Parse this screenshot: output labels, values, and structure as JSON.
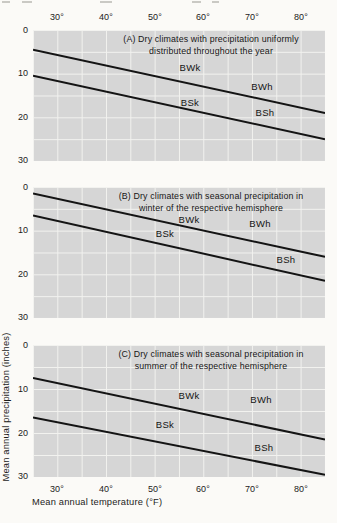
{
  "figure": {
    "description_domain": "Koppen dry climate boundary chart, three stacked panels"
  },
  "axes": {
    "x_title": "Mean annual temperature (°F)",
    "y_title": "Mean annual precipitation (inches)",
    "x_tick_labels": [
      "30°",
      "40°",
      "50°",
      "60°",
      "70°",
      "80°"
    ],
    "y_tick_labels": [
      "0",
      "10",
      "20",
      "30"
    ]
  },
  "panels": [
    {
      "letter": "A",
      "title_line1": "(A) Dry climates with precipitation uniformly",
      "title_line2": "distributed throughout the year"
    },
    {
      "letter": "B",
      "title_line1": "(B) Dry climates with seasonal precipitation in",
      "title_line2": "winter of the respective hemisphere"
    },
    {
      "letter": "C",
      "title_line1": "(C) Dry climates with seasonal precipitation in",
      "title_line2": "summer of the respective hemisphere"
    }
  ],
  "colors": {
    "panel_background": "#d6d6d6",
    "gridline": "#f2f2ef",
    "boundary_line": "#141414",
    "text": "#1b1b1b",
    "page_background": "#fbfaf7"
  },
  "chart_data": [
    {
      "type": "line",
      "title": "(A) Dry climates with precipitation uniformly distributed throughout the year",
      "xlabel": "Mean annual temperature (°F)",
      "ylabel": "Mean annual precipitation (inches)",
      "xlim": [
        25,
        85
      ],
      "ylim": [
        0,
        30
      ],
      "y_inverted": true,
      "x_ticks": [
        30,
        40,
        50,
        60,
        70,
        80
      ],
      "y_ticks": [
        0,
        10,
        20,
        30
      ],
      "grid": {
        "x_step": 5,
        "y_step": 5,
        "on": true
      },
      "legend": "none",
      "series": [
        {
          "name": "BW-BS boundary (upper line)",
          "x": [
            25,
            85
          ],
          "y": [
            4.5,
            19.0
          ]
        },
        {
          "name": "BS-humid boundary (lower line)",
          "x": [
            25,
            85
          ],
          "y": [
            10.5,
            25.0
          ]
        }
      ],
      "region_labels": [
        {
          "text": "BWk",
          "x": 57.5,
          "y": 8.5
        },
        {
          "text": "BWh",
          "x": 72,
          "y": 13
        },
        {
          "text": "BSk",
          "x": 57.5,
          "y": 16.5
        },
        {
          "text": "BSh",
          "x": 72.5,
          "y": 19
        }
      ]
    },
    {
      "type": "line",
      "title": "(B) Dry climates with seasonal precipitation in winter of the respective hemisphere",
      "xlabel": "Mean annual temperature (°F)",
      "ylabel": "Mean annual precipitation (inches)",
      "xlim": [
        25,
        85
      ],
      "ylim": [
        0,
        30
      ],
      "y_inverted": true,
      "x_ticks": [
        30,
        40,
        50,
        60,
        70,
        80
      ],
      "y_ticks": [
        0,
        10,
        20,
        30
      ],
      "grid": {
        "x_step": 5,
        "y_step": 5,
        "on": true
      },
      "legend": "none",
      "series": [
        {
          "name": "BW-BS boundary (upper line)",
          "x": [
            25,
            85
          ],
          "y": [
            1.5,
            16.0
          ]
        },
        {
          "name": "BS-humid boundary (lower line)",
          "x": [
            25,
            85
          ],
          "y": [
            6.5,
            21.5
          ]
        }
      ],
      "region_labels": [
        {
          "text": "BWk",
          "x": 57,
          "y": 7.5
        },
        {
          "text": "BWh",
          "x": 71.5,
          "y": 8.5
        },
        {
          "text": "BSk",
          "x": 52,
          "y": 11
        },
        {
          "text": "BSh",
          "x": 77,
          "y": 16.5
        }
      ]
    },
    {
      "type": "line",
      "title": "(C) Dry climates with seasonal precipitation in summer of the respective hemisphere",
      "xlabel": "Mean annual temperature (°F)",
      "ylabel": "Mean annual precipitation (inches)",
      "xlim": [
        25,
        85
      ],
      "ylim": [
        0,
        30
      ],
      "y_inverted": true,
      "x_ticks": [
        30,
        40,
        50,
        60,
        70,
        80
      ],
      "y_ticks": [
        0,
        10,
        20,
        30
      ],
      "grid": {
        "x_step": 5,
        "y_step": 5,
        "on": true
      },
      "legend": "none",
      "series": [
        {
          "name": "BW-BS boundary (upper line)",
          "x": [
            25,
            85
          ],
          "y": [
            7.5,
            21.5
          ]
        },
        {
          "name": "BS-humid boundary (lower line)",
          "x": [
            25,
            85
          ],
          "y": [
            16.5,
            29.5
          ]
        }
      ],
      "region_labels": [
        {
          "text": "BWk",
          "x": 57,
          "y": 11.5
        },
        {
          "text": "BWh",
          "x": 72,
          "y": 12.5
        },
        {
          "text": "BSk",
          "x": 52,
          "y": 18.5
        },
        {
          "text": "BSh",
          "x": 72.5,
          "y": 23.5
        }
      ]
    }
  ]
}
